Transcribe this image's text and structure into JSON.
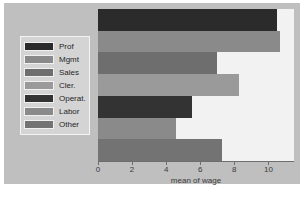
{
  "chart_data": {
    "type": "bar",
    "orientation": "horizontal",
    "title": "",
    "subtitle": "",
    "xlabel": "mean of wage",
    "ylabel": "",
    "xlim": [
      0,
      11.5
    ],
    "grid": false,
    "legend_position": "left-outside",
    "categories": [
      "Prof",
      "Mgmt",
      "Sales",
      "Cler.",
      "Operat.",
      "Labor",
      "Other"
    ],
    "values": [
      10.5,
      10.7,
      7.0,
      8.3,
      5.5,
      4.6,
      7.3
    ],
    "xticks": [
      0,
      2,
      4,
      6,
      8,
      10
    ],
    "xticklabels": [
      "0",
      "2",
      "4",
      "6",
      "8",
      "10"
    ],
    "bar_colors": [
      "#2b2b2b",
      "#8a8a8a",
      "#6e6e6e",
      "#9a9a9a",
      "#333333",
      "#8a8a8a",
      "#737373"
    ],
    "legend_entries": [
      {
        "label": "Prof",
        "color": "#2b2b2b"
      },
      {
        "label": "Mgmt",
        "color": "#8a8a8a"
      },
      {
        "label": "Sales",
        "color": "#6e6e6e"
      },
      {
        "label": "Cler.",
        "color": "#9a9a9a"
      },
      {
        "label": "Operat.",
        "color": "#333333"
      },
      {
        "label": "Labor",
        "color": "#8a8a8a"
      },
      {
        "label": "Other",
        "color": "#737373"
      }
    ]
  },
  "colors": {
    "page_background": "#ffffff",
    "graph_background": "#bfbfbf",
    "plot_background": "#f2f2f2",
    "axis_line": "#6e6e6e",
    "text": "#3b3b3b",
    "legend_background": "#d4d4d4",
    "legend_border": "#f4f4f4"
  }
}
